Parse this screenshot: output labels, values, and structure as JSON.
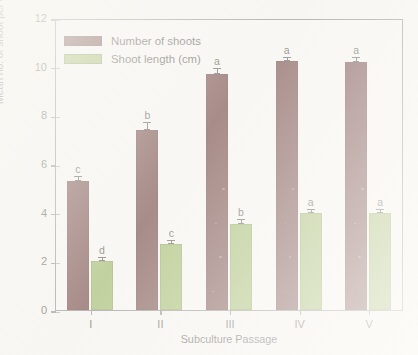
{
  "chart_data": {
    "type": "bar",
    "title": "",
    "xlabel": "Subculture Passage",
    "ylabel": "Mean no. of shoot per explant/Mean shoot length (cm)",
    "categories": [
      "I",
      "II",
      "III",
      "IV",
      "V"
    ],
    "ylim": [
      0,
      12
    ],
    "yticks": [
      0,
      2,
      4,
      6,
      8,
      10,
      12
    ],
    "grid": false,
    "legend_position": "top-left-inside",
    "series": [
      {
        "name": "Number of shoots",
        "color": "#4a0e0e",
        "values": [
          5.3,
          7.4,
          9.7,
          10.25,
          10.2
        ],
        "errors": [
          0.18,
          0.3,
          0.22,
          0.12,
          0.14
        ],
        "letters": [
          "c",
          "b",
          "a",
          "a",
          "a"
        ]
      },
      {
        "name": "Shoot length (cm)",
        "color": "#84a83e",
        "values": [
          2.0,
          2.7,
          3.55,
          4.0,
          4.0
        ],
        "errors": [
          0.12,
          0.14,
          0.16,
          0.1,
          0.1
        ],
        "letters": [
          "d",
          "c",
          "b",
          "a",
          "a"
        ]
      }
    ]
  },
  "axes": {
    "y_title": "Mean no. of shoot per explant/Mean shoot length (cm)",
    "x_title": "Subculture Passage",
    "y_tick_labels": [
      "0",
      "2",
      "4",
      "6",
      "8",
      "10",
      "12"
    ],
    "x_tick_labels": [
      "I",
      "II",
      "III",
      "IV",
      "V"
    ]
  },
  "legend": {
    "items": [
      {
        "label": "Number of shoots",
        "color": "#4a0e0e"
      },
      {
        "label": "Shoot length (cm)",
        "color": "#84a83e"
      }
    ]
  }
}
